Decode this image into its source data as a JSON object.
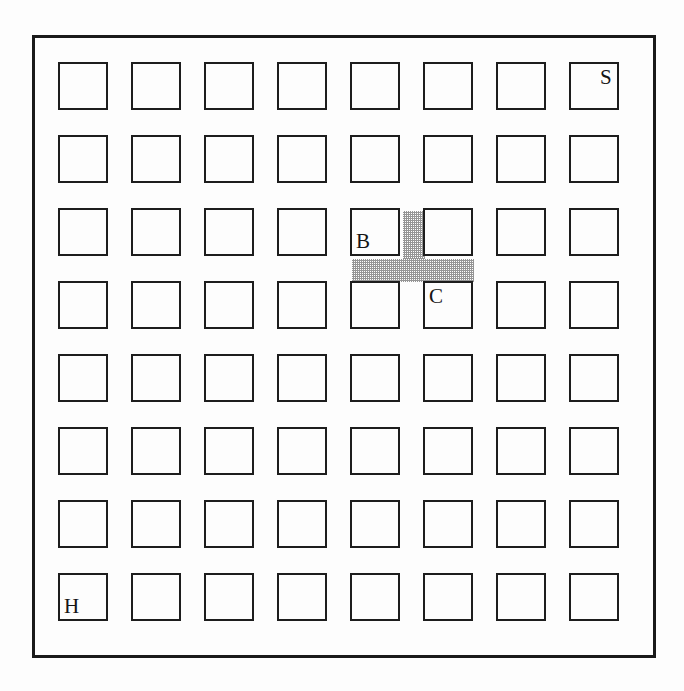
{
  "figure": {
    "type": "grid-diagram",
    "background_color": "#fdfdfd",
    "line_color": "#1a1a1a",
    "shade_color": "#8d8d8d"
  },
  "grid": {
    "rows": 8,
    "columns": 8,
    "cell_width_px": 50,
    "cell_height_px": 48,
    "column_pitch_px": 73,
    "row_pitch_px": 73,
    "origin_x_px": 58,
    "origin_y_px": 62
  },
  "border": {
    "x_px": 32,
    "y_px": 35,
    "width_px": 624,
    "height_px": 623,
    "stroke_px": 3
  },
  "labels": [
    {
      "text": "S",
      "row": 1,
      "column": 8,
      "anchor": "top-right",
      "name": "cell-label-s"
    },
    {
      "text": "B",
      "row": 3,
      "column": 5,
      "anchor": "bottom-left",
      "name": "cell-label-b"
    },
    {
      "text": "C",
      "row": 4,
      "column": 6,
      "anchor": "top-left",
      "name": "cell-label-c"
    },
    {
      "text": "H",
      "row": 8,
      "column": 1,
      "anchor": "bottom-left",
      "name": "cell-label-h"
    }
  ],
  "shaded_regions": [
    {
      "name": "corridor-vertical",
      "description": "vertical shaded gap between row 3 column 5 and row 3 column 6",
      "x_px": 403,
      "y_px": 211,
      "width_px": 22,
      "height_px": 48
    },
    {
      "name": "corridor-horizontal",
      "description": "horizontal shaded gap below row 3 spanning columns 5 and 6",
      "x_px": 352,
      "y_px": 259,
      "width_px": 122,
      "height_px": 23
    }
  ]
}
